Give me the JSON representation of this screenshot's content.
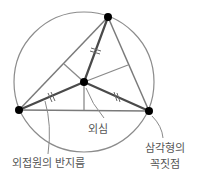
{
  "diagram": {
    "type": "circumcircle-of-triangle",
    "colors": {
      "circle": "#8c8c8c",
      "triangle": "#7a7a7a",
      "radius": "#4a4a4a",
      "bisector": "#8a8a8a",
      "point": "#000000",
      "leader": "#8a8a8a",
      "text": "#555555"
    },
    "circle": {
      "cx": 84,
      "cy": 82,
      "r": 70
    },
    "vertices": [
      {
        "name": "top",
        "x": 108,
        "y": 17
      },
      {
        "name": "left",
        "x": 19,
        "y": 110
      },
      {
        "name": "right",
        "x": 149,
        "y": 111
      }
    ],
    "circumcenter": {
      "x": 84,
      "y": 82
    },
    "tick_marks": "double (equal radii)"
  },
  "labels": {
    "circumcenter": "외심",
    "circumradius": "외접원의 반지름",
    "vertex_line1": "삼각형의",
    "vertex_line2": "꼭짓점"
  }
}
